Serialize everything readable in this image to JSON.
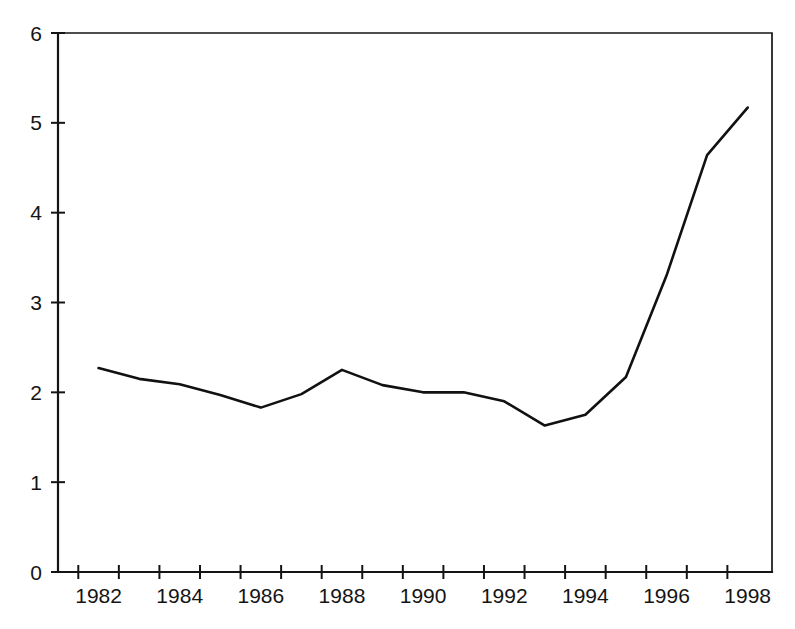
{
  "chart_data": {
    "type": "line",
    "title": "",
    "subtitle": "",
    "xlabel": "",
    "ylabel": "",
    "x": [
      1982,
      1983,
      1984,
      1985,
      1986,
      1987,
      1988,
      1989,
      1990,
      1991,
      1992,
      1993,
      1994,
      1995,
      1996,
      1997,
      1998
    ],
    "values": [
      2.27,
      2.15,
      2.09,
      1.97,
      1.83,
      1.98,
      2.25,
      2.08,
      2.0,
      2.0,
      1.9,
      1.63,
      1.75,
      2.17,
      3.3,
      4.64,
      5.17
    ],
    "series": [
      {
        "name": "series-1",
        "color": "#111111",
        "values": [
          2.27,
          2.15,
          2.09,
          1.97,
          1.83,
          1.98,
          2.25,
          2.08,
          2.0,
          2.0,
          1.9,
          1.63,
          1.75,
          2.17,
          3.3,
          4.64,
          5.17
        ]
      }
    ],
    "xlim": [
      1981,
      1998.6
    ],
    "ylim": [
      0,
      6
    ],
    "y_ticks": [
      0,
      1,
      2,
      3,
      4,
      5,
      6
    ],
    "y_tick_labels": [
      "0",
      "1",
      "2",
      "3",
      "4",
      "5",
      "6"
    ],
    "x_ticks": [
      1981.5,
      1982.5,
      1983.5,
      1984.5,
      1985.5,
      1986.5,
      1987.5,
      1988.5,
      1989.5,
      1990.5,
      1991.5,
      1992.5,
      1993.5,
      1994.5,
      1995.5,
      1996.5,
      1997.5
    ],
    "x_tick_labels": [
      "1982",
      "1984",
      "1986",
      "1988",
      "1990",
      "1992",
      "1994",
      "1996",
      "1998"
    ],
    "x_tick_label_positions": [
      1982,
      1984,
      1986,
      1988,
      1990,
      1992,
      1994,
      1996,
      1998
    ],
    "grid": false,
    "legend": null,
    "legend_position": "none",
    "annotations": []
  },
  "axes": {
    "line_color": "#141414",
    "background": "#ffffff"
  }
}
